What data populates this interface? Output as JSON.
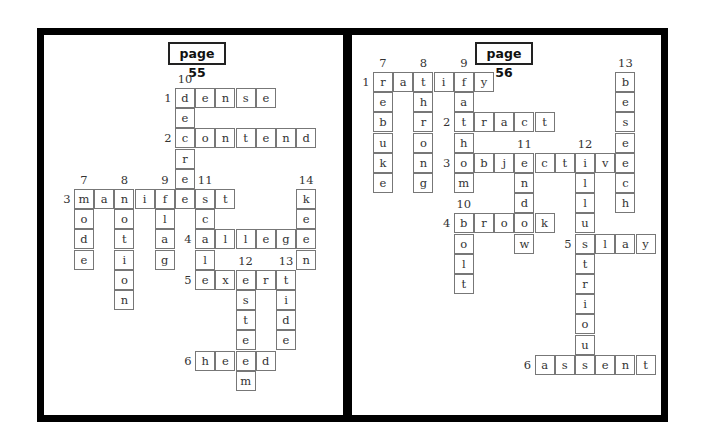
{
  "pages": [
    {
      "title": "page 55",
      "origin": [
        74,
        88
      ],
      "title_pos": [
        168,
        42
      ],
      "words": [
        {
          "num": "1",
          "dir": "across",
          "word": "dense",
          "row": 0,
          "col": 5
        },
        {
          "num": "2",
          "dir": "across",
          "word": "contend",
          "row": 2,
          "col": 5
        },
        {
          "num": "3",
          "dir": "across",
          "word": "manifest",
          "row": 5,
          "col": 0
        },
        {
          "num": "4",
          "dir": "across",
          "word": "allege",
          "row": 7,
          "col": 6
        },
        {
          "num": "5",
          "dir": "across",
          "word": "exert",
          "row": 9,
          "col": 6
        },
        {
          "num": "6",
          "dir": "across",
          "word": "heed",
          "row": 13,
          "col": 6
        },
        {
          "num": "7",
          "dir": "down",
          "word": "mode",
          "row": 5,
          "col": 0
        },
        {
          "num": "8",
          "dir": "down",
          "word": "notion",
          "row": 5,
          "col": 2
        },
        {
          "num": "9",
          "dir": "down",
          "word": "flag",
          "row": 5,
          "col": 4
        },
        {
          "num": "10",
          "dir": "down",
          "word": "decree",
          "row": 0,
          "col": 5
        },
        {
          "num": "11",
          "dir": "down",
          "word": "scale",
          "row": 5,
          "col": 6
        },
        {
          "num": "12",
          "dir": "down",
          "word": "esteem",
          "row": 9,
          "col": 8
        },
        {
          "num": "13",
          "dir": "down",
          "word": "tide",
          "row": 9,
          "col": 10
        },
        {
          "num": "14",
          "dir": "down",
          "word": "keen",
          "row": 5,
          "col": 11
        }
      ]
    },
    {
      "title": "page 56",
      "origin": [
        373,
        72
      ],
      "title_pos": [
        475,
        42
      ],
      "words": [
        {
          "num": "1",
          "dir": "across",
          "word": "ratify",
          "row": 0,
          "col": 0
        },
        {
          "num": "2",
          "dir": "across",
          "word": "tract",
          "row": 2,
          "col": 4
        },
        {
          "num": "3",
          "dir": "across",
          "word": "objective",
          "row": 4,
          "col": 4
        },
        {
          "num": "4",
          "dir": "across",
          "word": "brook",
          "row": 7,
          "col": 4
        },
        {
          "num": "5",
          "dir": "across",
          "word": "slay",
          "row": 8,
          "col": 10
        },
        {
          "num": "6",
          "dir": "across",
          "word": "assent",
          "row": 14,
          "col": 8
        },
        {
          "num": "7",
          "dir": "down",
          "word": "rebuke",
          "row": 0,
          "col": 0
        },
        {
          "num": "8",
          "dir": "down",
          "word": "throng",
          "row": 0,
          "col": 2
        },
        {
          "num": "9",
          "dir": "down",
          "word": "fathom",
          "row": 0,
          "col": 4
        },
        {
          "num": "10",
          "dir": "down",
          "word": "bolt",
          "row": 7,
          "col": 4
        },
        {
          "num": "11",
          "dir": "down",
          "word": "endow",
          "row": 4,
          "col": 7
        },
        {
          "num": "12",
          "dir": "down",
          "word": "illustrious",
          "row": 4,
          "col": 10
        },
        {
          "num": "13",
          "dir": "down",
          "word": "beseech",
          "row": 0,
          "col": 12
        }
      ]
    }
  ]
}
